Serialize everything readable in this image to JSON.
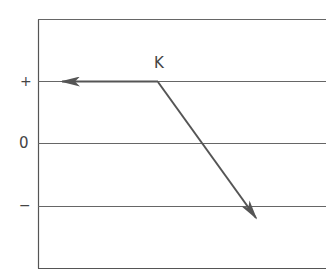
{
  "diagram": {
    "labels": {
      "vector_label": "K",
      "plus": "+",
      "zero": "0",
      "minus": "−"
    },
    "colors": {
      "line": "#555555",
      "arrow": "#555555",
      "background": "#ffffff"
    },
    "levels": [
      "+",
      "0",
      "−"
    ],
    "vectors": [
      {
        "name": "horizontal-arrow",
        "from": "K on + line",
        "direction": "left"
      },
      {
        "name": "diagonal-arrow",
        "from": "K on + line",
        "direction": "down-right to below − line"
      }
    ]
  }
}
